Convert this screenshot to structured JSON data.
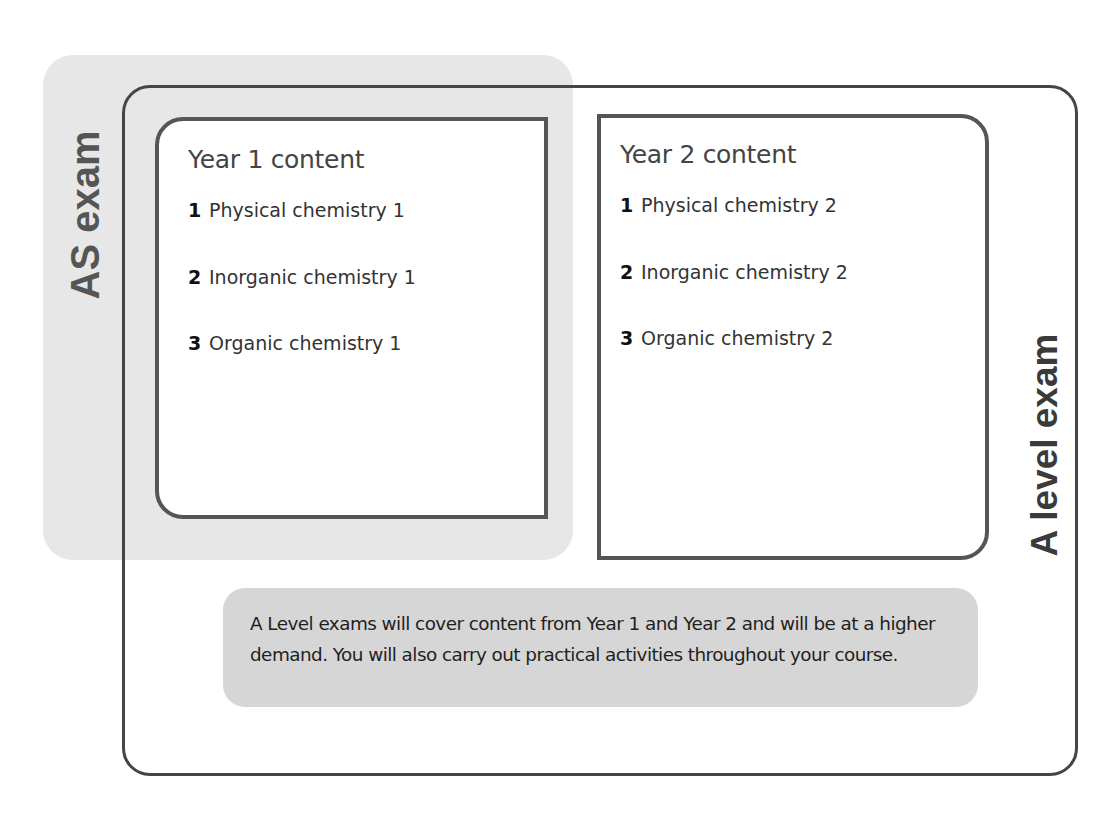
{
  "diagram": {
    "as_exam_label": "AS exam",
    "a_level_exam_label": "A level exam",
    "year1": {
      "title": "Year 1 content",
      "items": [
        {
          "num": "1",
          "label": "Physical chemistry 1"
        },
        {
          "num": "2",
          "label": "Inorganic chemistry 1"
        },
        {
          "num": "3",
          "label": "Organic chemistry 1"
        }
      ]
    },
    "year2": {
      "title": "Year 2 content",
      "items": [
        {
          "num": "1",
          "label": "Physical chemistry 2"
        },
        {
          "num": "2",
          "label": "Inorganic chemistry 2"
        },
        {
          "num": "3",
          "label": "Organic chemistry 2"
        }
      ]
    },
    "note": "A Level exams will cover content from Year 1 and Year 2 and will be at a higher demand. You will also carry out practical activities throughout your course.",
    "colors": {
      "as_panel": "#e7e7e7",
      "outer_border": "#454545",
      "year_box_border": "#555555",
      "note_background": "#d6d6d6"
    }
  }
}
